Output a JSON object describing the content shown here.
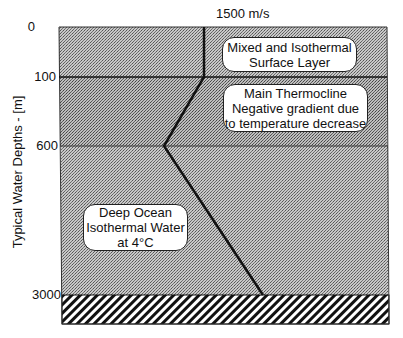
{
  "diagram": {
    "title_speed": "1500 m/s",
    "y_axis_label": "Typical Water Depths - [m]",
    "depth_ticks": [
      {
        "label": "0",
        "y": 27
      },
      {
        "label": "100",
        "y": 77
      },
      {
        "label": "600",
        "y": 146
      },
      {
        "label": "3000",
        "y": 295
      }
    ],
    "layers": [
      {
        "name": "Mixed and Isothermal Surface Layer",
        "lines": [
          "Mixed and Isothermal",
          "Surface Layer"
        ]
      },
      {
        "name": "Main Thermocline",
        "lines": [
          "Main Thermocline",
          "Negative gradient due",
          "to temperature decrease"
        ]
      },
      {
        "name": "Deep Ocean Isothermal Water",
        "lines": [
          "Deep Ocean",
          "Isothermal Water",
          "at 4°C"
        ]
      }
    ],
    "colors": {
      "water_fill": "#b8b8b8",
      "thermocline_fill": "#a9a9a9",
      "seabed_hatch": "#111111",
      "line": "#111111"
    }
  }
}
